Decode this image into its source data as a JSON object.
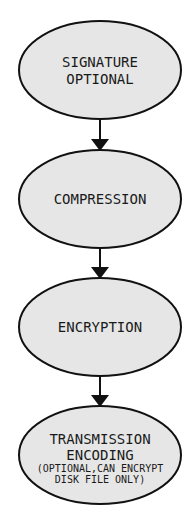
{
  "diagram": {
    "type": "flowchart",
    "colors": {
      "node_fill": "#e6e6e6",
      "stroke": "#111111",
      "text": "#1a1a1a"
    },
    "nodes": [
      {
        "id": "signature",
        "lines": [
          "SIGNATURE",
          "OPTIONAL"
        ]
      },
      {
        "id": "compression",
        "lines": [
          "COMPRESSION"
        ]
      },
      {
        "id": "encryption",
        "lines": [
          "ENCRYPTION"
        ]
      },
      {
        "id": "transmission",
        "lines": [
          "TRANSMISSION",
          "ENCODING",
          "(OPTIONAL,CAN ENCRYPT",
          "DISK FILE ONLY)"
        ]
      }
    ],
    "edges": [
      {
        "from": "signature",
        "to": "compression"
      },
      {
        "from": "compression",
        "to": "encryption"
      },
      {
        "from": "encryption",
        "to": "transmission"
      }
    ]
  }
}
